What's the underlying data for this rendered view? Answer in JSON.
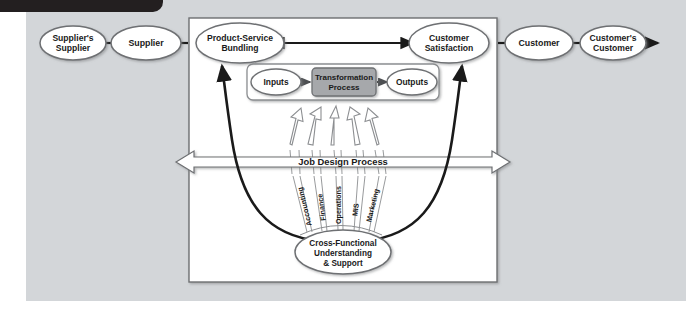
{
  "page": {
    "background_color": "#ffffff",
    "panel_color": "#d3d6d9",
    "tab_color": "#231f20"
  },
  "diagram": {
    "title_tab": "",
    "chain": {
      "suppliers_supplier": "Supplier's\nSupplier",
      "suppliers_supplier_line1": "Supplier's",
      "suppliers_supplier_line2": "Supplier",
      "supplier": "Supplier",
      "customer": "Customer",
      "customers_customer_line1": "Customer's",
      "customers_customer_line2": "Customer"
    },
    "core": {
      "product_service_line1": "Product-Service",
      "product_service_line2": "Bundling",
      "customer_satisfaction_line1": "Customer",
      "customer_satisfaction_line2": "Satisfaction",
      "inputs": "Inputs",
      "transformation_line1": "Transformation",
      "transformation_line2": "Process",
      "outputs": "Outputs",
      "job_design_process": "Job Design Process",
      "cross_functional_line1": "Cross-Functional",
      "cross_functional_line2": "Understanding",
      "cross_functional_line3": "& Support"
    },
    "functions": [
      "Accounting",
      "Finance",
      "Operations",
      "MIS",
      "Marketing"
    ],
    "colors": {
      "oval_stroke": "#6e7073",
      "oval_fill": "#ffffff",
      "transformation_fill": "#a6a8ab",
      "arrow_black": "#1a1a1a",
      "arrow_hollow_stroke": "#8c8e91",
      "box_stroke": "#6e7073",
      "text": "#1a1a1a"
    }
  }
}
